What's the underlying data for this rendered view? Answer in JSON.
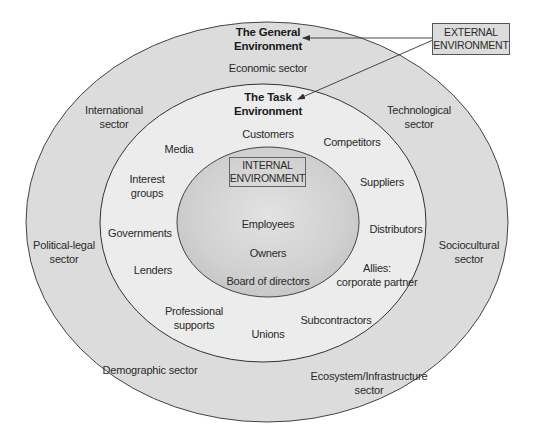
{
  "colors": {
    "outer_ring": "#dcdcdc",
    "middle_ring": "#ececec",
    "inner_core": "#cdcdcd",
    "outline": "#444444",
    "text": "#2a2a2a"
  },
  "external_box": {
    "line1": "EXTERNAL",
    "line2": "ENVIRONMENT"
  },
  "general_environment": {
    "title_line1": "The General",
    "title_line2": "Environment",
    "sectors": {
      "economic": "Economic sector",
      "international_l1": "International",
      "international_l2": "sector",
      "technological_l1": "Technological",
      "technological_l2": "sector",
      "political_l1": "Political-legal",
      "political_l2": "sector",
      "sociocultural_l1": "Sociocultural",
      "sociocultural_l2": "sector",
      "demographic": "Demographic sector",
      "ecosystem_l1": "Ecosystem/Infrastructure",
      "ecosystem_l2": "sector"
    }
  },
  "task_environment": {
    "title_line1": "The Task",
    "title_line2": "Environment",
    "items": {
      "customers": "Customers",
      "competitors": "Competitors",
      "media": "Media",
      "interest_l1": "Interest",
      "interest_l2": "groups",
      "suppliers": "Suppliers",
      "governments": "Governments",
      "distributors": "Distributors",
      "lenders": "Lenders",
      "allies_l1": "Allies:",
      "allies_l2": "corporate partner",
      "professional_l1": "Professional",
      "professional_l2": "supports",
      "subcontractors": "Subcontractors",
      "unions": "Unions"
    }
  },
  "internal_environment": {
    "box_line1": "INTERNAL",
    "box_line2": "ENVIRONMENT",
    "items": {
      "employees": "Employees",
      "owners": "Owners",
      "board": "Board of directors"
    }
  }
}
